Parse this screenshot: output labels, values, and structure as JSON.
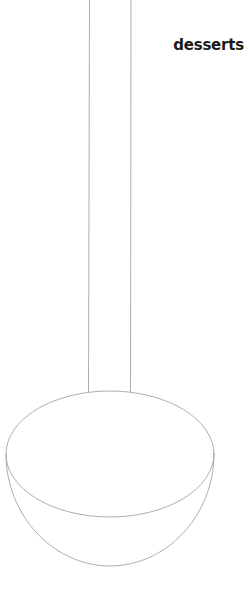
{
  "page": {
    "width": 249,
    "height": 612,
    "background_color": "#ffffff",
    "kind": "scanned-line-art-page"
  },
  "heading": {
    "text": "desserts",
    "color": "#1a1a1a",
    "weight": "bold",
    "position": "top-right"
  },
  "illustration": {
    "name": "ladle",
    "description": "line drawing of a ladle: long straight handle descending into a rounded bowl",
    "stroke_color": "#9a9a9a",
    "stroke_width": 0.8,
    "fill": "none",
    "parts": {
      "handle": {
        "name": "handle",
        "left_line_x": 89,
        "right_line_x": 131,
        "top_y": 0,
        "bottom_y": 392
      },
      "rim": {
        "name": "bowl-rim-ellipse",
        "center_x": 110,
        "center_y": 454,
        "radius_x": 104,
        "radius_y": 63
      },
      "bowl": {
        "name": "bowl-body-arc",
        "left_x": 6,
        "right_x": 214,
        "top_y": 454,
        "bottom_y": 566
      }
    }
  }
}
